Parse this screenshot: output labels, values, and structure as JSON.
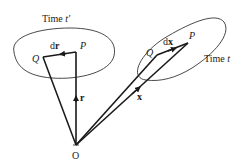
{
  "diagram": {
    "left_region": {
      "title_prefix": "Time ",
      "title_var": "t′",
      "point_Q": "Q",
      "point_P": "P",
      "vector_d_prefix": "d",
      "vector_d_var": "r",
      "position_vector": "r"
    },
    "right_region": {
      "title_prefix": "Time ",
      "title_var": "t",
      "point_Q": "Q",
      "point_P": "P",
      "vector_d_prefix": "d",
      "vector_d_var": "x",
      "position_vector": "x"
    },
    "origin": "O",
    "stroke_color": "#1a1a1a"
  }
}
